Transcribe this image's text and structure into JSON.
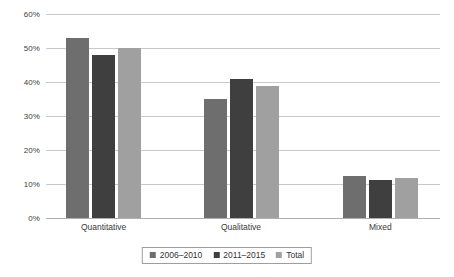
{
  "chart_data": {
    "type": "bar",
    "title": "",
    "subtitle": "",
    "xlabel": "",
    "ylabel": "",
    "categories": [
      "Quantitative",
      "Qualitative",
      "Mixed"
    ],
    "series": [
      {
        "name": "2006–2010",
        "color": "#6e6e6e",
        "values": [
          53.0,
          35.0,
          12.3
        ]
      },
      {
        "name": "2011–2015",
        "color": "#3f3f3f",
        "values": [
          48.0,
          41.0,
          11.3
        ]
      },
      {
        "name": "Total",
        "color": "#a0a0a0",
        "values": [
          50.0,
          38.7,
          11.7
        ]
      }
    ],
    "ylim": [
      0,
      60
    ],
    "yticks": [
      0,
      10,
      20,
      30,
      40,
      50,
      60
    ],
    "ytick_labels": [
      "0%",
      "10%",
      "20%",
      "30%",
      "40%",
      "50%",
      "60%"
    ],
    "grid": true,
    "grid_axis": "y",
    "legend_position": "bottom",
    "value_format": "percent"
  }
}
